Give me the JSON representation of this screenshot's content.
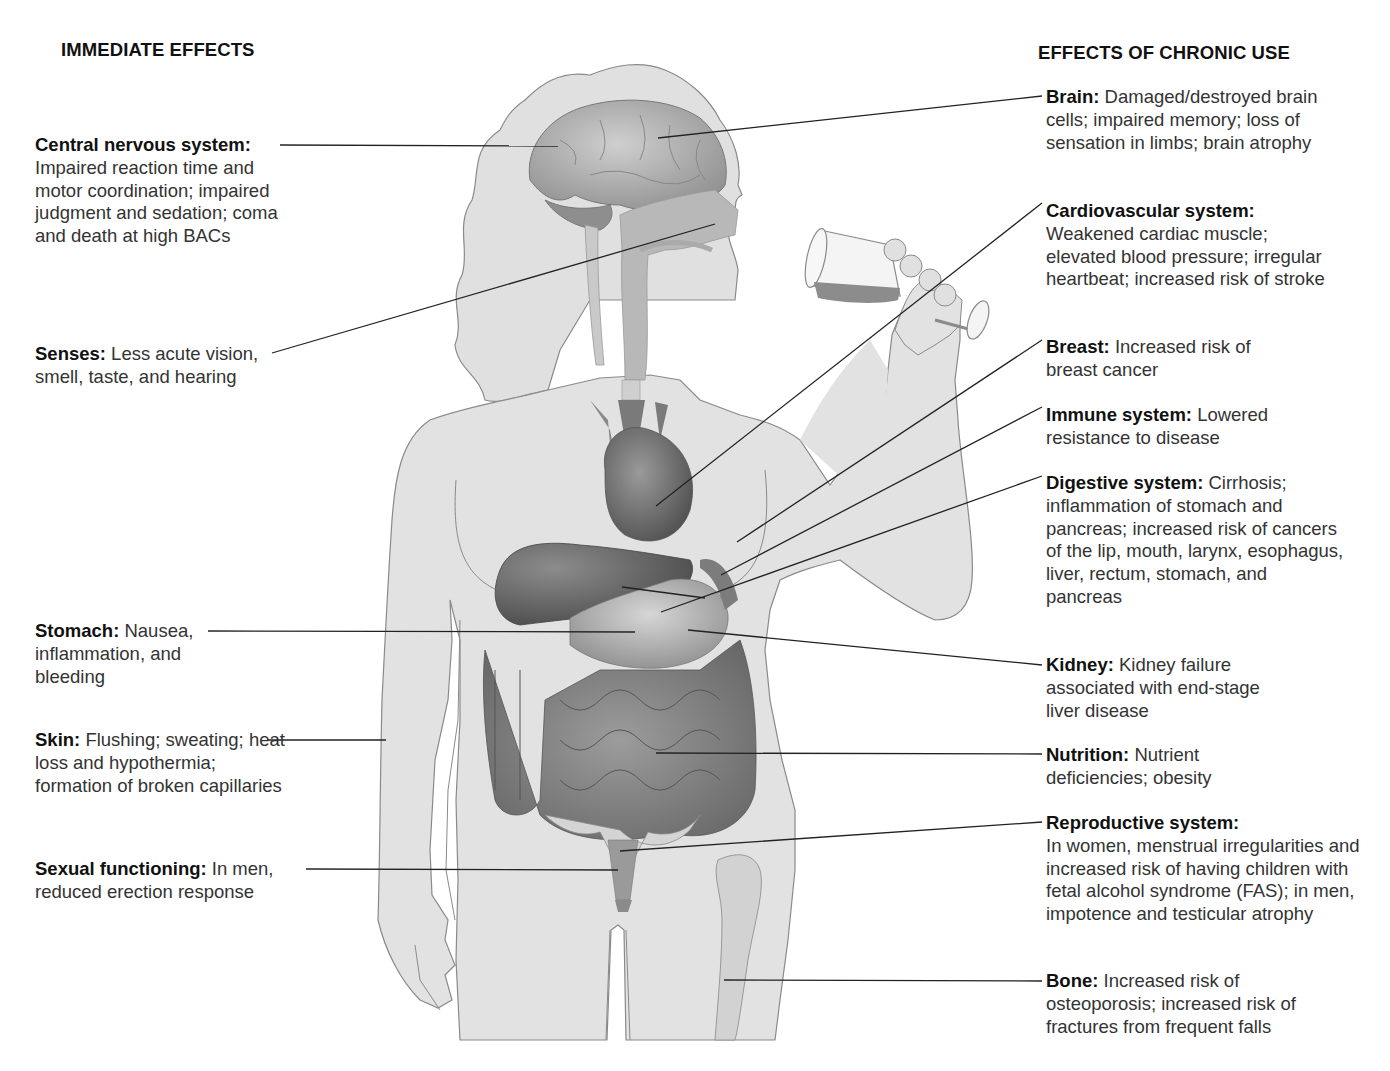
{
  "headings": {
    "immediate": "IMMEDIATE EFFECTS",
    "chronic": "EFFECTS OF CHRONIC USE"
  },
  "immediate_effects": [
    {
      "term": "Central nervous system:",
      "text": "Impaired reaction time and motor coordination; impaired judgment and sedation; coma and death at high BACs"
    },
    {
      "term": "Senses:",
      "text": "Less acute vision, smell, taste, and hearing"
    },
    {
      "term": "Stomach:",
      "text": "Nausea, inflammation, and bleeding"
    },
    {
      "term": "Skin:",
      "text": "Flushing; sweating; heat loss and hypothermia; formation of broken capillaries"
    },
    {
      "term": "Sexual functioning:",
      "text": "In men, reduced erection response"
    }
  ],
  "chronic_effects": [
    {
      "term": "Brain:",
      "text": "Damaged/destroyed brain cells; impaired memory; loss of sensation in limbs; brain atrophy"
    },
    {
      "term": "Cardiovascular system:",
      "text": "Weakened cardiac muscle; elevated blood pressure; irregular heartbeat; increased risk of stroke"
    },
    {
      "term": "Breast:",
      "text": "Increased risk of breast cancer"
    },
    {
      "term": "Immune system:",
      "text": "Lowered resistance to disease"
    },
    {
      "term": "Digestive system:",
      "text": "Cirrhosis; inflammation of stomach and pancreas; increased risk of cancers of the lip, mouth, larynx, esophagus, liver, rectum, stomach, and pancreas"
    },
    {
      "term": "Kidney:",
      "text": "Kidney failure associated with end-stage liver disease"
    },
    {
      "term": "Nutrition:",
      "text": "Nutrient deficiencies; obesity"
    },
    {
      "term": "Reproductive system:",
      "text": "In women, menstrual irregularities and increased risk of having children with fetal alcohol syndrome (FAS); in men, impotence and testicular atrophy"
    },
    {
      "term": "Bone:",
      "text": "Increased risk of osteoporosis; increased risk of fractures from frequent falls"
    }
  ],
  "colors": {
    "body_fill": "#e2e2e2",
    "body_outline": "#8a8a8a",
    "organ_dark": "#6e6e6e",
    "organ_mid": "#9a9a9a",
    "leader_line": "#222222"
  }
}
